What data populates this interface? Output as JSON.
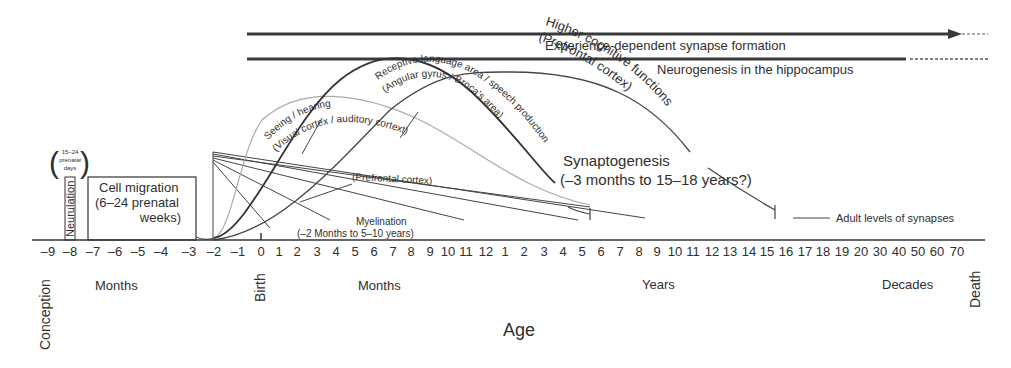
{
  "figure": {
    "x_axis_title": "Age",
    "bands": {
      "experience": "Experience-dependent synapse formation",
      "neurogenesis": "Neurogenesis in the hippocampus"
    },
    "neurulation": {
      "label": "Neurulation",
      "note_line1": "15–24",
      "note_line2": "prenatal",
      "note_line3": "days"
    },
    "cell_migration": {
      "line1": "Cell migration",
      "line2": "(6–24 prenatal",
      "line3": "weeks)"
    },
    "curves": {
      "seeing_hearing": {
        "line1": "Seeing / hearing",
        "line2": "(Visual cortex / auditory cortext)"
      },
      "language": {
        "line1": "Receptive language area / speech production",
        "line2": "(Angular gyrus / Broca's area)"
      },
      "higher_cognitive": {
        "line1": "Higher cognitive functions",
        "line2": "(Prefrontal cortex)"
      }
    },
    "prefrontal_label": "(Prefrontal cortex)",
    "myelination": {
      "line1": "Myelination",
      "line2": "(–2 Months to 5–10 years)"
    },
    "synaptogenesis": {
      "line1": "Synaptogenesis",
      "line2": "(–3 months to 15–18 years?)"
    },
    "adult_levels": "Adult levels of synapses",
    "axis_group_labels": {
      "conception": "Conception",
      "months_prenatal": "Months",
      "birth": "Birth",
      "months_postnatal": "Months",
      "years": "Years",
      "decades": "Decades",
      "death": "Death"
    },
    "ticks": [
      {
        "label": "–9",
        "x": 48
      },
      {
        "label": "–8",
        "x": 70
      },
      {
        "label": "–7",
        "x": 93
      },
      {
        "label": "–6",
        "x": 115
      },
      {
        "label": "–5",
        "x": 138
      },
      {
        "label": "–4",
        "x": 161
      },
      {
        "label": "–3",
        "x": 189
      },
      {
        "label": "–2",
        "x": 214
      },
      {
        "label": "–1",
        "x": 238
      },
      {
        "label": "0",
        "x": 261
      },
      {
        "label": "1",
        "x": 279
      },
      {
        "label": "2",
        "x": 297
      },
      {
        "label": "3",
        "x": 317
      },
      {
        "label": "4",
        "x": 336
      },
      {
        "label": "5",
        "x": 355
      },
      {
        "label": "6",
        "x": 374
      },
      {
        "label": "7",
        "x": 393
      },
      {
        "label": "8",
        "x": 411
      },
      {
        "label": "9",
        "x": 430
      },
      {
        "label": "10",
        "x": 448
      },
      {
        "label": "11",
        "x": 466
      },
      {
        "label": "12",
        "x": 486
      },
      {
        "label": "1",
        "x": 505
      },
      {
        "label": "2",
        "x": 524
      },
      {
        "label": "3",
        "x": 544
      },
      {
        "label": "4",
        "x": 563
      },
      {
        "label": "5",
        "x": 582
      },
      {
        "label": "6",
        "x": 601
      },
      {
        "label": "7",
        "x": 620
      },
      {
        "label": "8",
        "x": 639
      },
      {
        "label": "9",
        "x": 657
      },
      {
        "label": "10",
        "x": 675
      },
      {
        "label": "11",
        "x": 693
      },
      {
        "label": "12",
        "x": 712
      },
      {
        "label": "13",
        "x": 730
      },
      {
        "label": "14",
        "x": 749
      },
      {
        "label": "15",
        "x": 767
      },
      {
        "label": "16",
        "x": 786
      },
      {
        "label": "17",
        "x": 805
      },
      {
        "label": "18",
        "x": 823
      },
      {
        "label": "19",
        "x": 842
      },
      {
        "label": "20",
        "x": 861
      },
      {
        "label": "30",
        "x": 880
      },
      {
        "label": "40",
        "x": 899
      },
      {
        "label": "50",
        "x": 918
      },
      {
        "label": "60",
        "x": 937
      },
      {
        "label": "70",
        "x": 957
      }
    ]
  }
}
